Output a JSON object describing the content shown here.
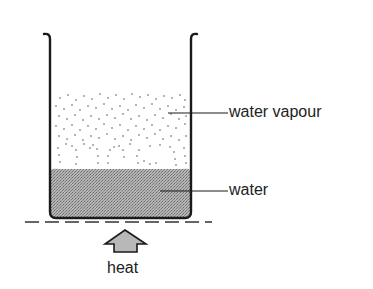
{
  "diagram": {
    "title": "",
    "labels": {
      "vapour": "water vapour",
      "water": "water",
      "heat": "heat"
    },
    "colors": {
      "outline": "#1a1a1a",
      "water_fill": "#a9a9a9",
      "vapour_dots": "#555555",
      "arrow_fill": "#b8b8b8",
      "text": "#222222"
    },
    "components": [
      "beaker",
      "water",
      "water-vapour",
      "heat-source-line",
      "heat-arrow"
    ]
  }
}
